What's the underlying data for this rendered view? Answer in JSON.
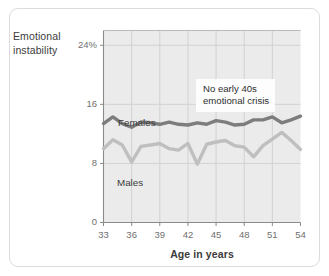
{
  "chart_data": {
    "type": "line",
    "title": "",
    "xlabel": "Age in years",
    "ylabel": "Emotional instability",
    "ylabel_lines": [
      "Emotional",
      "instability"
    ],
    "xlim": [
      33,
      54
    ],
    "ylim": [
      0,
      26
    ],
    "grid": true,
    "grid_color": "#d2d2d2",
    "plot_background": "#ebebeb",
    "legend_position": "inline-labels",
    "xticks": [
      33,
      36,
      39,
      42,
      45,
      48,
      51,
      54
    ],
    "xtick_labels": [
      "33",
      "36",
      "39",
      "42",
      "45",
      "48",
      "51",
      "54"
    ],
    "yticks": [
      0,
      8,
      16,
      24
    ],
    "ytick_labels": [
      "0",
      "8",
      "16",
      "24%"
    ],
    "x": [
      33,
      34,
      35,
      36,
      37,
      38,
      39,
      40,
      41,
      42,
      43,
      44,
      45,
      46,
      47,
      48,
      49,
      50,
      51,
      52,
      53,
      54
    ],
    "series": [
      {
        "name": "Females",
        "color": "#7d7d7d",
        "label": "Females",
        "values": [
          13.4,
          14.3,
          13.4,
          12.9,
          13.6,
          13.5,
          13.3,
          13.6,
          13.3,
          13.2,
          13.5,
          13.3,
          13.8,
          13.6,
          13.2,
          13.3,
          13.9,
          13.9,
          14.3,
          13.5,
          13.9,
          14.4
        ]
      },
      {
        "name": "Males",
        "color": "#bfbfbf",
        "label": "Males",
        "values": [
          10.0,
          11.2,
          10.5,
          8.2,
          10.3,
          10.5,
          10.7,
          10.0,
          9.8,
          10.7,
          7.9,
          10.6,
          10.9,
          11.1,
          10.4,
          10.2,
          8.9,
          10.4,
          11.3,
          12.2,
          11.1,
          9.9
        ]
      }
    ],
    "annotations": [
      {
        "name": "no-early-40s-crisis",
        "lines": [
          "No early 40s",
          "emotional crisis"
        ],
        "text": "No early 40s emotional crisis"
      }
    ]
  },
  "colors": {
    "card_border": "#dcdcdc",
    "plot_fill": "#ebebeb",
    "grid": "#d2d2d2",
    "axis": "#8a8a8a",
    "females": "#7d7d7d",
    "males": "#bfbfbf",
    "text": "#3b3b3b",
    "tick_text": "#6f6f6f"
  }
}
